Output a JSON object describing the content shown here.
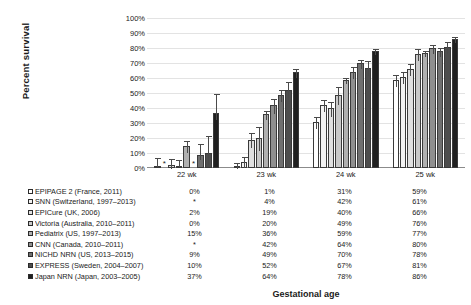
{
  "chart_data": {
    "type": "bar",
    "title": "",
    "xlabel": "Gestational age",
    "ylabel": "Percent survival",
    "categories": [
      "22 wk",
      "23 wk",
      "24 wk",
      "25 wk"
    ],
    "ylim": [
      0,
      100
    ],
    "ytick_labels": [
      "0%",
      "10%",
      "20%",
      "30%",
      "40%",
      "50%",
      "60%",
      "70%",
      "80%",
      "90%",
      "100%"
    ],
    "ytick_values": [
      0,
      10,
      20,
      30,
      40,
      50,
      60,
      70,
      80,
      90,
      100
    ],
    "grid": true,
    "legend_position": "bottom-table",
    "missing_marker": "*",
    "series": [
      {
        "name": "EPIPAGE 2 (France, 2011)",
        "swatch": "#ffffff",
        "values": [
          0,
          1,
          31,
          59
        ],
        "labels": [
          "0%",
          "1%",
          "31%",
          "59%"
        ],
        "err_low": [
          0,
          0,
          27,
          55
        ],
        "err_high": [
          6,
          4,
          35,
          63
        ]
      },
      {
        "name": "SNN (Switzerland, 1997–2013)",
        "swatch": "#f2f2f2",
        "values": [
          null,
          4,
          42,
          61
        ],
        "labels": [
          "*",
          "4%",
          "42%",
          "61%"
        ],
        "err_low": [
          null,
          1,
          38,
          57
        ],
        "err_high": [
          null,
          8,
          46,
          65
        ]
      },
      {
        "name": "EPICure (UK, 2006)",
        "swatch": "#e0e0e0",
        "values": [
          2,
          19,
          40,
          66
        ],
        "labels": [
          "2%",
          "19%",
          "40%",
          "66%"
        ],
        "err_low": [
          0,
          14,
          35,
          62
        ],
        "err_high": [
          7,
          24,
          45,
          70
        ]
      },
      {
        "name": "Victoria (Australia, 2010–2011)",
        "swatch": "#c9c9c9",
        "values": [
          0,
          20,
          49,
          76
        ],
        "labels": [
          "0%",
          "20%",
          "49%",
          "76%"
        ],
        "err_low": [
          0,
          12,
          43,
          72
        ],
        "err_high": [
          5,
          28,
          55,
          80
        ]
      },
      {
        "name": "Pediatrix (US, 1997–2013)",
        "swatch": "#b0b0b0",
        "values": [
          15,
          36,
          59,
          77
        ],
        "labels": [
          "15%",
          "36%",
          "59%",
          "77%"
        ],
        "err_low": [
          11,
          33,
          57,
          75
        ],
        "err_high": [
          19,
          39,
          61,
          79
        ]
      },
      {
        "name": "CNN (Canada, 2010–2011)",
        "swatch": "#8f8f8f",
        "values": [
          null,
          42,
          64,
          80
        ],
        "labels": [
          "*",
          "42%",
          "64%",
          "80%"
        ],
        "err_low": [
          null,
          37,
          60,
          77
        ],
        "err_high": [
          null,
          47,
          68,
          83
        ]
      },
      {
        "name": "NICHD NRN (US, 2013–2015)",
        "swatch": "#6f6f6f",
        "values": [
          9,
          49,
          70,
          78
        ],
        "labels": [
          "9%",
          "49%",
          "70%",
          "78%"
        ],
        "err_low": [
          6,
          45,
          67,
          75
        ],
        "err_high": [
          17,
          53,
          73,
          81
        ]
      },
      {
        "name": "EXPRESS (Sweden, 2004–2007)",
        "swatch": "#4d4d4d",
        "values": [
          10,
          52,
          67,
          81
        ],
        "labels": [
          "10%",
          "52%",
          "67%",
          "81%"
        ],
        "err_low": [
          3,
          46,
          62,
          77
        ],
        "err_high": [
          22,
          58,
          72,
          85
        ]
      },
      {
        "name": "Japan NRN (Japan, 2003–2005)",
        "swatch": "#1f1f1f",
        "values": [
          37,
          64,
          78,
          86
        ],
        "labels": [
          "37%",
          "64%",
          "78%",
          "86%"
        ],
        "err_low": [
          33,
          61,
          76,
          84
        ],
        "err_high": [
          50,
          67,
          80,
          88
        ]
      }
    ]
  }
}
